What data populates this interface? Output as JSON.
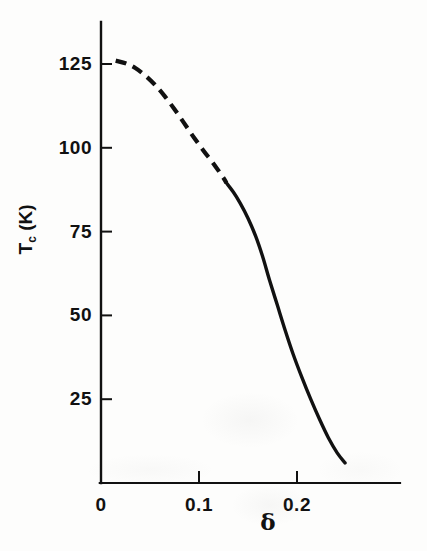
{
  "chart_data": {
    "type": "line",
    "title": "",
    "subtitle": "",
    "xlabel": "δ",
    "ylabel": "T_c (K)",
    "ylabel_base": "T",
    "ylabel_sub": "c",
    "ylabel_unit": " (K)",
    "xlim": [
      0,
      0.2727
    ],
    "ylim": [
      0,
      138
    ],
    "grid": false,
    "legend": null,
    "x_ticks": [
      {
        "value": 0,
        "label": "0"
      },
      {
        "value": 0.1,
        "label": "0.1"
      },
      {
        "value": 0.2,
        "label": "0.2"
      }
    ],
    "y_ticks": [
      {
        "value": 25,
        "label": "25"
      },
      {
        "value": 50,
        "label": "50"
      },
      {
        "value": 75,
        "label": "75"
      },
      {
        "value": 100,
        "label": "100"
      },
      {
        "value": 125,
        "label": "125"
      }
    ],
    "series": [
      {
        "name": "Tc vs delta (extrapolated)",
        "style": "dashed",
        "color": "#111111",
        "points": [
          [
            0.015,
            126.0
          ],
          [
            0.025,
            125.2
          ],
          [
            0.035,
            123.8
          ],
          [
            0.045,
            121.6
          ],
          [
            0.055,
            118.8
          ],
          [
            0.065,
            115.4
          ],
          [
            0.075,
            111.5
          ],
          [
            0.085,
            107.3
          ],
          [
            0.095,
            103.0
          ],
          [
            0.105,
            99.0
          ],
          [
            0.115,
            95.2
          ],
          [
            0.125,
            91.0
          ],
          [
            0.128,
            89.5
          ]
        ]
      },
      {
        "name": "Tc vs delta (measured)",
        "style": "solid",
        "color": "#111111",
        "points": [
          [
            0.128,
            89.5
          ],
          [
            0.135,
            86.8
          ],
          [
            0.142,
            83.5
          ],
          [
            0.15,
            79.0
          ],
          [
            0.158,
            73.5
          ],
          [
            0.165,
            67.5
          ],
          [
            0.172,
            60.5
          ],
          [
            0.18,
            53.0
          ],
          [
            0.188,
            45.5
          ],
          [
            0.196,
            38.5
          ],
          [
            0.205,
            31.5
          ],
          [
            0.214,
            25.0
          ],
          [
            0.223,
            19.0
          ],
          [
            0.232,
            13.5
          ],
          [
            0.241,
            9.0
          ],
          [
            0.249,
            6.0
          ]
        ]
      }
    ],
    "annotations": []
  }
}
